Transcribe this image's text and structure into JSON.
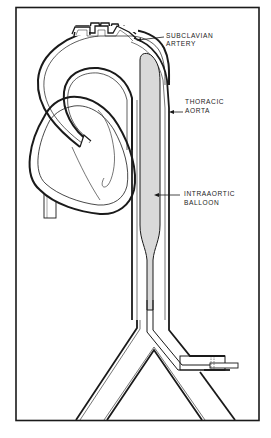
{
  "figure": {
    "colors": {
      "ink": "#1a1a1a",
      "balloon_fill": "#d9d9d9",
      "background": "#ffffff"
    }
  },
  "labels": {
    "subclavian": {
      "line1": "SUBCLAVIAN",
      "line2": "ARTERY"
    },
    "thoracic": {
      "line1": "THORACIC",
      "line2": "AORTA"
    },
    "balloon": {
      "line1": "INTRAAORTIC",
      "line2": "BALLOON"
    }
  },
  "structures": [
    "heart",
    "aortic-arch",
    "arch-branch-vessels",
    "descending-thoracic-aorta",
    "intraaortic-balloon",
    "catheter",
    "aortic-bifurcation",
    "femoral-insertion-sheath"
  ]
}
